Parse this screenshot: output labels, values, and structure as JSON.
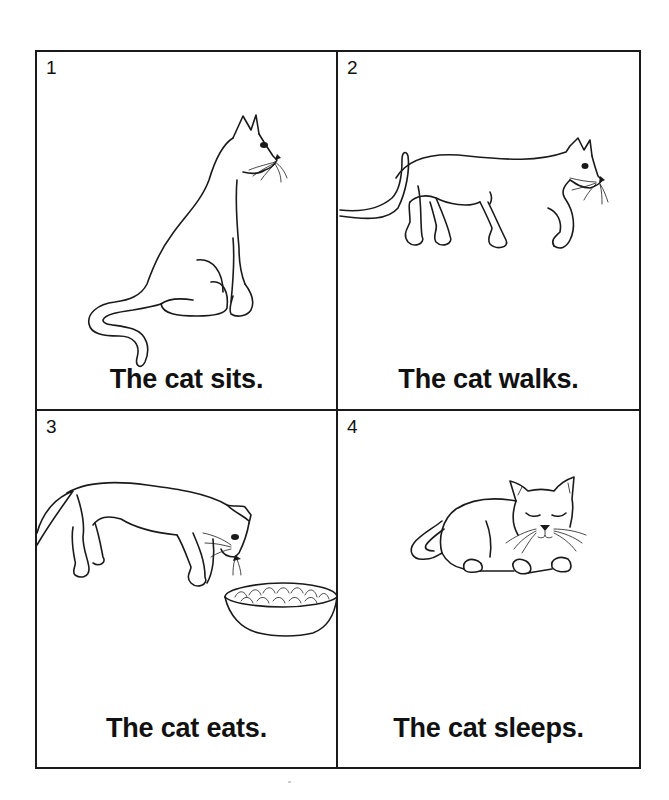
{
  "worksheet": {
    "panels": [
      {
        "number": "1",
        "caption": "The cat sits.",
        "illustration": "cat-sitting"
      },
      {
        "number": "2",
        "caption": "The cat walks.",
        "illustration": "cat-walking"
      },
      {
        "number": "3",
        "caption": "The cat eats.",
        "illustration": "cat-eating-from-bowl"
      },
      {
        "number": "4",
        "caption": "The cat sleeps.",
        "illustration": "cat-sleeping"
      }
    ]
  }
}
